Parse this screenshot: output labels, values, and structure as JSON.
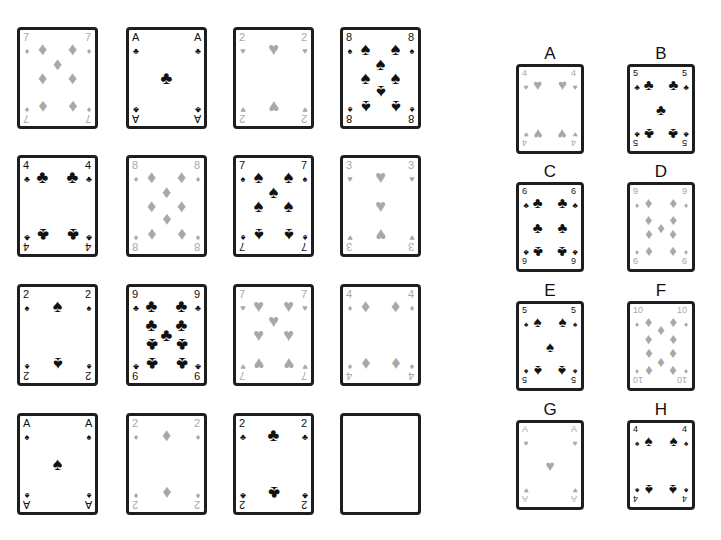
{
  "colors": {
    "black_suit": "#111111",
    "red_suit": "#a8a8a8",
    "card_border": "#1e1e1e"
  },
  "grid": {
    "cards": [
      {
        "rank": "7",
        "suit": "diamonds"
      },
      {
        "rank": "A",
        "suit": "clubs"
      },
      {
        "rank": "2",
        "suit": "hearts"
      },
      {
        "rank": "8",
        "suit": "spades"
      },
      {
        "rank": "4",
        "suit": "clubs"
      },
      {
        "rank": "8",
        "suit": "diamonds"
      },
      {
        "rank": "7",
        "suit": "spades"
      },
      {
        "rank": "3",
        "suit": "hearts"
      },
      {
        "rank": "2",
        "suit": "spades"
      },
      {
        "rank": "9",
        "suit": "clubs"
      },
      {
        "rank": "7",
        "suit": "hearts"
      },
      {
        "rank": "4",
        "suit": "diamonds"
      },
      {
        "rank": "A",
        "suit": "spades"
      },
      {
        "rank": "2",
        "suit": "diamonds"
      },
      {
        "rank": "2",
        "suit": "clubs"
      },
      {
        "rank": "",
        "suit": "empty"
      }
    ]
  },
  "options": [
    {
      "label": "A",
      "rank": "4",
      "suit": "hearts"
    },
    {
      "label": "B",
      "rank": "5",
      "suit": "clubs"
    },
    {
      "label": "C",
      "rank": "6",
      "suit": "clubs"
    },
    {
      "label": "D",
      "rank": "9",
      "suit": "diamonds"
    },
    {
      "label": "E",
      "rank": "5",
      "suit": "spades"
    },
    {
      "label": "F",
      "rank": "10",
      "suit": "diamonds"
    },
    {
      "label": "G",
      "rank": "A",
      "suit": "hearts"
    },
    {
      "label": "H",
      "rank": "4",
      "suit": "spades"
    }
  ]
}
